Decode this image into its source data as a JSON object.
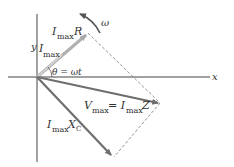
{
  "diagram": {
    "type": "phasor-diagram",
    "axes": {
      "x_label": "x",
      "y_label": "y"
    },
    "rotation_label": "ω",
    "angle_label": "θ = ωt",
    "phasors": [
      {
        "id": "resistor",
        "label_main": "I",
        "label_sub": "max",
        "label_tail": "R",
        "color": "#9a9a9a"
      },
      {
        "id": "current",
        "label_main": "I",
        "label_sub": "max",
        "label_tail": "",
        "color": "#c8c8c8"
      },
      {
        "id": "total",
        "label_main": "V",
        "label_sub": "max",
        "label_eq": " = I",
        "label_sub2": "max",
        "label_tail": "Z",
        "color": "#707070"
      },
      {
        "id": "capacitor",
        "label_main": "I",
        "label_sub": "max",
        "label_tail": "X",
        "label_tail_sub": "C",
        "color": "#707070"
      }
    ]
  }
}
